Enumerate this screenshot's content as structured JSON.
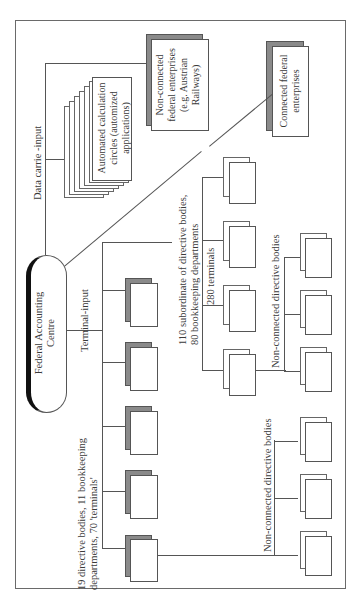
{
  "figure": {
    "orientation": "rotated 90 degrees counter-clockwise",
    "centre": {
      "label_line1": "Federal Accounting",
      "label_line2": "Centre"
    },
    "data_carrier": {
      "label": "Data carrie -input",
      "automated": {
        "line1": "Automated calculation",
        "line2": "circles (automized",
        "line3": "applications)"
      },
      "non_connected_enterprises": {
        "line1": "Non-connected",
        "line2": "federal enterprises",
        "line3": "(e.g. Austrian",
        "line4": "Railways)"
      }
    },
    "connected_enterprises": {
      "line1": "Connected federal",
      "line2": "enterprises"
    },
    "terminal_input": {
      "label": "Terminal-input",
      "directive_group": {
        "line1": "19 directive bodies, 11 bookkeeping",
        "line2": "departments, 70 'terminals'",
        "box_count": 5
      },
      "subordinate_group": {
        "line1": "110 subordinate of directive bodies,",
        "line2": "80 bookkeeping departments",
        "terminals_label": "280 terminals",
        "box_count": 4
      },
      "non_connected_upper": {
        "label": "Non-connected directive bodies",
        "box_count": 3
      },
      "non_connected_lower": {
        "label": "Non-connected directive bodies",
        "box_count": 3
      }
    },
    "colors": {
      "line": "#555555",
      "shadow": "#8a8a8a",
      "pill_accent": "#111111",
      "background": "#ffffff"
    }
  }
}
